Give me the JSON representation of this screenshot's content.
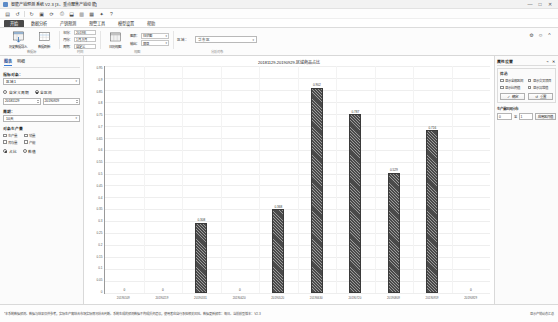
{
  "window": {
    "title": "智能产销预测系统 V2.3  [3、重点聚焦产销动能]",
    "minimize": "—",
    "maximize": "□",
    "close": "✕"
  },
  "quick_access": {
    "icons": [
      {
        "name": "save-icon",
        "glyph": "▤"
      },
      {
        "name": "undo-icon",
        "glyph": "↺"
      },
      {
        "name": "redo-icon",
        "glyph": "↻"
      },
      {
        "name": "open-icon",
        "glyph": "▣"
      },
      {
        "name": "refresh-icon",
        "glyph": "⟳"
      },
      {
        "name": "print-icon",
        "glyph": "⎙"
      },
      {
        "name": "export-icon",
        "glyph": "⬓"
      },
      {
        "name": "chart-icon",
        "glyph": "▥"
      },
      {
        "name": "table-icon",
        "glyph": "▦"
      },
      {
        "name": "star-icon",
        "glyph": "✦"
      },
      {
        "name": "help-icon",
        "glyph": "?"
      }
    ]
  },
  "ribbon_tabs": [
    {
      "label": "开始",
      "active": true
    },
    {
      "label": "数据分析",
      "active": false
    },
    {
      "label": "产销预测",
      "active": false
    },
    {
      "label": "预警工具",
      "active": false
    },
    {
      "label": "模型设置",
      "active": false
    },
    {
      "label": "帮助",
      "active": false
    }
  ],
  "ribbon": {
    "groups": [
      {
        "name": "数据源",
        "label": "数据源",
        "buttons": [
          {
            "name": "import-data-button",
            "label": "历史数据导入",
            "icon": "import-icon"
          },
          {
            "name": "refresh-data-button",
            "label": "数据刷新",
            "icon": "refresh-icon"
          }
        ]
      },
      {
        "name": "时间范围",
        "label": "时间",
        "rows": [
          {
            "label": "年份：",
            "value": "2019年"
          },
          {
            "label": "月份：",
            "value": "1月-9月"
          },
          {
            "label": "周期：",
            "value": "自定义"
          }
        ]
      },
      {
        "name": "视图",
        "label": "视图",
        "buttons": [
          {
            "name": "calendar-view-button",
            "label": "日历视图",
            "icon": "calendar-icon"
          }
        ],
        "rows": [
          {
            "label": "图表：",
            "value": "柱状图"
          },
          {
            "label": "输出：",
            "value": "屏显"
          }
        ]
      },
      {
        "name": "分析对象",
        "label": "分析对象",
        "combo_label": "区域：",
        "combo_value": "华东区"
      }
    ],
    "right_icons": [
      {
        "name": "settings-icon",
        "glyph": "⚙"
      },
      {
        "name": "user-icon",
        "glyph": "☺"
      },
      {
        "name": "collapse-ribbon-icon",
        "glyph": "^"
      }
    ]
  },
  "left_panel": {
    "tabs": [
      {
        "label": "图表",
        "active": true
      },
      {
        "label": "明细",
        "active": false
      }
    ],
    "analysis_object": {
      "label": "指标对象：",
      "value": "区域1"
    },
    "period": {
      "mode_custom": "自定义周期",
      "mode_all": "全区间",
      "mode_all_selected": true,
      "date_from": "20181129",
      "date_to": "20190929"
    },
    "grouping": {
      "label": "周期：",
      "value": "10天"
    },
    "display_content": {
      "label": "对象生产量",
      "options": [
        {
          "label": "生产量",
          "checked": false
        },
        {
          "label": "销量",
          "checked": false
        },
        {
          "label": "库存量",
          "checked": false
        },
        {
          "label": "产能",
          "checked": false
        }
      ],
      "radio_label_a": "占比",
      "radio_label_b": "数值",
      "radio_a_selected": true
    }
  },
  "right_panel": {
    "title": "属性设置",
    "pin_icons": [
      {
        "name": "pin-icon",
        "glyph": "⌁"
      },
      {
        "name": "close-panel-icon",
        "glyph": "✕"
      }
    ],
    "filter_group": {
      "title": "筛选",
      "checkboxes": [
        {
          "label": "显示全部区间",
          "checked": false
        },
        {
          "label": "显示交叉项目",
          "checked": false
        },
        {
          "label": "显示比例值",
          "checked": false
        },
        {
          "label": "显示异常值",
          "checked": false
        }
      ],
      "buttons": [
        {
          "name": "confirm-button",
          "label": "确定",
          "icon": "check-icon"
        },
        {
          "name": "reset-button",
          "label": "重置",
          "icon": "reset-icon"
        }
      ]
    },
    "threshold": {
      "title": "生产量区间分布",
      "min": "0",
      "to": "至",
      "max": "1",
      "apply_label": "应用区间值"
    }
  },
  "status_bar": {
    "message": "*本系统数据预测、数据与结果仅供参考，实际生产需结合市场实际情况综合判断。系统生成的预测数据不构成投资建议，使用者应自行承担相关风险。数据更新频率：每日。当前模型版本：V2.3",
    "right": "显示产销动态汇总"
  },
  "chart_data": {
    "type": "bar",
    "title": "20181129-20190929-区域商品占比",
    "xlabel": "",
    "ylabel": "",
    "ylim": [
      0,
      1
    ],
    "grid": true,
    "legend": "none",
    "categories": [
      "20190109",
      "20190219",
      "20190331",
      "20190420",
      "20190520",
      "20190630",
      "20190720",
      "20190809",
      "20190919",
      "20190929"
    ],
    "values": [
      0,
      0,
      0.308,
      0,
      0.368,
      0.902,
      0.787,
      0.529,
      0.716,
      0
    ],
    "labels": [
      "0",
      "0",
      "0.308",
      "0",
      "0.368",
      "0.902",
      "0.787",
      "0.529",
      "0.716",
      "0"
    ],
    "ytick_labels": [
      "0.95",
      "0.9",
      "0.85",
      "0.8",
      "0.75",
      "0.7",
      "0.65",
      "0.6",
      "0.55",
      "0.5",
      "0.45",
      "0.4",
      "0.35",
      "0.3",
      "0.25",
      "0.2",
      "0.15",
      "0.1",
      "0.05",
      "0"
    ],
    "bar_color": "#4a4a4a",
    "bar_pattern": "diagonal-hatch"
  }
}
